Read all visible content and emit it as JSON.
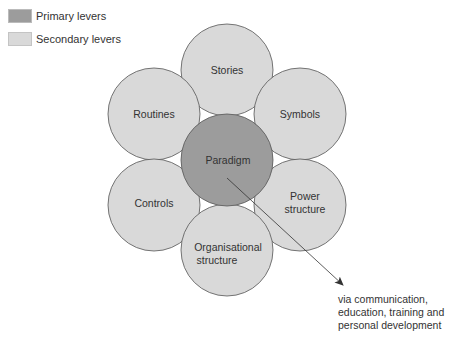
{
  "legend": {
    "primary_label": "Primary levers",
    "secondary_label": "Secondary levers",
    "primary_color": "#9c9c9c",
    "secondary_color": "#d9d9d9"
  },
  "circles": {
    "stories": "Stories",
    "symbols": "Symbols",
    "power_line1": "Power",
    "power_line2": "structure",
    "org_line1": "Organisational",
    "org_line2": "structure",
    "controls": "Controls",
    "routines": "Routines",
    "paradigm": "Paradigm"
  },
  "annotation": {
    "line1": "via communication,",
    "line2": "education, training and",
    "line3": "personal development"
  }
}
